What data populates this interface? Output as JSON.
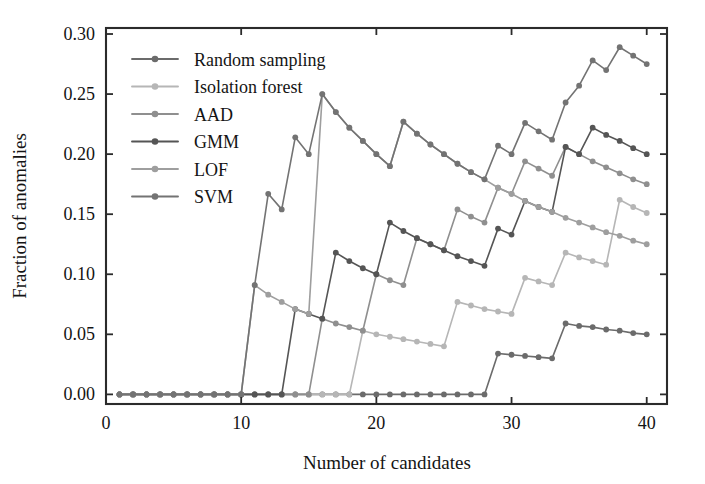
{
  "chart_data": {
    "type": "line",
    "title": "",
    "xlabel": "Number of candidates",
    "ylabel": "Fraction of anomalies",
    "xlim": [
      0,
      41.5
    ],
    "ylim": [
      -0.008,
      0.305
    ],
    "xticks": [
      0,
      10,
      20,
      30,
      40
    ],
    "xticklabels": [
      "0",
      "10",
      "20",
      "30",
      "40"
    ],
    "yticks": [
      0.0,
      0.05,
      0.1,
      0.15,
      0.2,
      0.25,
      0.3
    ],
    "yticklabels": [
      "0.00",
      "0.05",
      "0.10",
      "0.15",
      "0.20",
      "0.25",
      "0.30"
    ],
    "grid": false,
    "legend_position": "upper left",
    "marker": "circle",
    "x": [
      1,
      2,
      3,
      4,
      5,
      6,
      7,
      8,
      9,
      10,
      11,
      12,
      13,
      14,
      15,
      16,
      17,
      18,
      19,
      20,
      21,
      22,
      23,
      24,
      25,
      26,
      27,
      28,
      29,
      30,
      31,
      32,
      33,
      34,
      35,
      36,
      37,
      38,
      39,
      40
    ],
    "series": [
      {
        "name": "Random sampling",
        "color": "#6b6b6b",
        "values": [
          0,
          0,
          0,
          0,
          0,
          0,
          0,
          0,
          0,
          0,
          0,
          0,
          0,
          0,
          0,
          0,
          0,
          0,
          0,
          0,
          0,
          0,
          0,
          0,
          0,
          0,
          0,
          0,
          0.034,
          0.033,
          0.032,
          0.031,
          0.03,
          0.059,
          0.057,
          0.056,
          0.054,
          0.053,
          0.051,
          0.05
        ]
      },
      {
        "name": "Isolation forest",
        "color": "#b6b6b6",
        "values": [
          0,
          0,
          0,
          0,
          0,
          0,
          0,
          0,
          0,
          0,
          0,
          0,
          0,
          0,
          0,
          0,
          0,
          0,
          0.053,
          0.05,
          0.048,
          0.046,
          0.044,
          0.042,
          0.04,
          0.077,
          0.074,
          0.071,
          0.069,
          0.067,
          0.097,
          0.094,
          0.091,
          0.118,
          0.114,
          0.111,
          0.108,
          0.162,
          0.156,
          0.151
        ]
      },
      {
        "name": "AAD",
        "color": "#8f8f8f",
        "values": [
          0,
          0,
          0,
          0,
          0,
          0,
          0,
          0,
          0,
          0,
          0,
          0,
          0,
          0,
          0,
          0.063,
          0.059,
          0.056,
          0.053,
          0.1,
          0.095,
          0.091,
          0.13,
          0.125,
          0.12,
          0.154,
          0.148,
          0.143,
          0.172,
          0.167,
          0.194,
          0.188,
          0.182,
          0.206,
          0.2,
          0.194,
          0.189,
          0.184,
          0.179,
          0.175
        ]
      },
      {
        "name": "GMM",
        "color": "#555555",
        "values": [
          0,
          0,
          0,
          0,
          0,
          0,
          0,
          0,
          0,
          0,
          0,
          0,
          0,
          0.071,
          0.067,
          0.063,
          0.118,
          0.111,
          0.105,
          0.1,
          0.143,
          0.136,
          0.13,
          0.125,
          0.12,
          0.115,
          0.111,
          0.107,
          0.138,
          0.133,
          0.161,
          0.156,
          0.152,
          0.206,
          0.2,
          0.222,
          0.216,
          0.211,
          0.205,
          0.2
        ]
      },
      {
        "name": "LOF",
        "color": "#9e9e9e",
        "values": [
          0,
          0,
          0,
          0,
          0,
          0,
          0,
          0,
          0,
          0,
          0.091,
          0.083,
          0.077,
          0.071,
          0.067,
          0.25,
          0.235,
          0.222,
          0.211,
          0.2,
          0.19,
          0.227,
          0.217,
          0.208,
          0.2,
          0.192,
          0.185,
          0.179,
          0.172,
          0.167,
          0.161,
          0.156,
          0.152,
          0.147,
          0.143,
          0.139,
          0.135,
          0.132,
          0.128,
          0.125
        ]
      },
      {
        "name": "SVM",
        "color": "#737373",
        "values": [
          0,
          0,
          0,
          0,
          0,
          0,
          0,
          0,
          0,
          0,
          0.091,
          0.167,
          0.154,
          0.214,
          0.2,
          0.25,
          0.235,
          0.222,
          0.211,
          0.2,
          0.19,
          0.227,
          0.217,
          0.208,
          0.2,
          0.192,
          0.185,
          0.179,
          0.207,
          0.2,
          0.226,
          0.219,
          0.212,
          0.243,
          0.257,
          0.278,
          0.27,
          0.289,
          0.282,
          0.275
        ]
      }
    ]
  },
  "legend": {
    "entries": [
      {
        "label": "Random sampling"
      },
      {
        "label": "Isolation forest"
      },
      {
        "label": "AAD"
      },
      {
        "label": "GMM"
      },
      {
        "label": "LOF"
      },
      {
        "label": "SVM"
      }
    ]
  },
  "colors": {
    "axis": "#2b2b2b",
    "text": "#141414",
    "background": "#ffffff"
  }
}
